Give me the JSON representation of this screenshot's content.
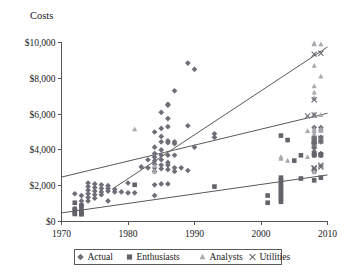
{
  "chart_data": {
    "type": "scatter",
    "title": "",
    "ylabel": "Costs",
    "xlabel": "",
    "xlim": [
      1970,
      2010
    ],
    "ylim": [
      0,
      10000
    ],
    "grid": false,
    "legend_position": "bottom",
    "xticks": [
      "1970",
      "1980",
      "1990",
      "2000",
      "2010"
    ],
    "xtick_values": [
      1970,
      1980,
      1990,
      2000,
      2010
    ],
    "yticks": [
      "$0",
      "$2,000",
      "$4,000",
      "$6,000",
      "$8,000",
      "$10,000"
    ],
    "ytick_values": [
      0,
      2000,
      4000,
      6000,
      8000,
      10000
    ],
    "series": [
      {
        "name": "Actual",
        "marker": "diamond",
        "color": "#6e6e78",
        "points": [
          [
            1972,
            1550
          ],
          [
            1972,
            700
          ],
          [
            1973,
            1450
          ],
          [
            1973,
            1150
          ],
          [
            1973,
            900
          ],
          [
            1974,
            2150
          ],
          [
            1974,
            1950
          ],
          [
            1974,
            1750
          ],
          [
            1974,
            1550
          ],
          [
            1974,
            1350
          ],
          [
            1974,
            1150
          ],
          [
            1975,
            2100
          ],
          [
            1975,
            1900
          ],
          [
            1975,
            1700
          ],
          [
            1975,
            1500
          ],
          [
            1975,
            1300
          ],
          [
            1976,
            2050
          ],
          [
            1976,
            1850
          ],
          [
            1976,
            1650
          ],
          [
            1976,
            1500
          ],
          [
            1977,
            2000
          ],
          [
            1977,
            1850
          ],
          [
            1977,
            1700
          ],
          [
            1977,
            1150
          ],
          [
            1978,
            1800
          ],
          [
            1978,
            1650
          ],
          [
            1979,
            1650
          ],
          [
            1980,
            2150
          ],
          [
            1980,
            1600
          ],
          [
            1981,
            1600
          ],
          [
            1982,
            3050
          ],
          [
            1983,
            3450
          ],
          [
            1983,
            3000
          ],
          [
            1984,
            5000
          ],
          [
            1984,
            4150
          ],
          [
            1984,
            3800
          ],
          [
            1984,
            3600
          ],
          [
            1984,
            3400
          ],
          [
            1984,
            3200
          ],
          [
            1984,
            3000
          ],
          [
            1984,
            2800
          ],
          [
            1984,
            2050
          ],
          [
            1984,
            1450
          ],
          [
            1985,
            6100
          ],
          [
            1985,
            5200
          ],
          [
            1985,
            4750
          ],
          [
            1985,
            4450
          ],
          [
            1985,
            4000
          ],
          [
            1985,
            3700
          ],
          [
            1985,
            3450
          ],
          [
            1985,
            3150
          ],
          [
            1985,
            2950
          ],
          [
            1985,
            2100
          ],
          [
            1986,
            6550
          ],
          [
            1986,
            6500
          ],
          [
            1986,
            5750
          ],
          [
            1986,
            5300
          ],
          [
            1986,
            4500
          ],
          [
            1986,
            4400
          ],
          [
            1986,
            3700
          ],
          [
            1986,
            3300
          ],
          [
            1986,
            3150
          ],
          [
            1986,
            2900
          ],
          [
            1986,
            2100
          ],
          [
            1987,
            7300
          ],
          [
            1987,
            4450
          ],
          [
            1987,
            4350
          ],
          [
            1987,
            3700
          ],
          [
            1987,
            3000
          ],
          [
            1987,
            2800
          ],
          [
            1988,
            3000
          ],
          [
            1989,
            8850
          ],
          [
            1989,
            5350
          ],
          [
            1989,
            2850
          ],
          [
            1990,
            8500
          ],
          [
            1990,
            4150
          ],
          [
            1993,
            4900
          ],
          [
            1993,
            4700
          ],
          [
            2008,
            5250
          ],
          [
            2008,
            4700
          ],
          [
            2008,
            4400
          ],
          [
            2008,
            4100
          ],
          [
            2008,
            3900
          ],
          [
            2008,
            3800
          ],
          [
            2008,
            3700
          ],
          [
            2009,
            5250
          ],
          [
            2009,
            5100
          ],
          [
            2009,
            4700
          ],
          [
            2009,
            4450
          ],
          [
            2009,
            3800
          ],
          [
            2009,
            3700
          ]
        ]
      },
      {
        "name": "Enthusiasts",
        "marker": "square",
        "color": "#63636b",
        "points": [
          [
            1972,
            1050
          ],
          [
            1972,
            700
          ],
          [
            1972,
            500
          ],
          [
            1972,
            420
          ],
          [
            1973,
            900
          ],
          [
            1973,
            700
          ],
          [
            1973,
            560
          ],
          [
            1973,
            450
          ],
          [
            1973,
            400
          ],
          [
            1981,
            2050
          ],
          [
            1993,
            1950
          ],
          [
            2001,
            1450
          ],
          [
            2001,
            1050
          ],
          [
            2003,
            2450
          ],
          [
            2003,
            2300
          ],
          [
            2003,
            2150
          ],
          [
            2003,
            2000
          ],
          [
            2003,
            1850
          ],
          [
            2003,
            1700
          ],
          [
            2003,
            1550
          ],
          [
            2003,
            1400
          ],
          [
            2003,
            1250
          ],
          [
            2003,
            1100
          ],
          [
            2003,
            4800
          ],
          [
            2004,
            4550
          ],
          [
            2005,
            3400
          ],
          [
            2006,
            2400
          ],
          [
            2006,
            3700
          ],
          [
            2008,
            3750
          ],
          [
            2008,
            3700
          ],
          [
            2008,
            2300
          ],
          [
            2008,
            2850
          ],
          [
            2009,
            3750
          ],
          [
            2009,
            3700
          ],
          [
            2009,
            2450
          ]
        ]
      },
      {
        "name": "Analysts",
        "marker": "triangle",
        "color": "#a9a9b0",
        "points": [
          [
            1981,
            5150
          ],
          [
            1984,
            3100
          ],
          [
            1984,
            2800
          ],
          [
            2003,
            3600
          ],
          [
            2003,
            3500
          ],
          [
            2004,
            3400
          ],
          [
            2007,
            5050
          ],
          [
            2007,
            3600
          ],
          [
            2008,
            9950
          ],
          [
            2008,
            9900
          ],
          [
            2008,
            8700
          ],
          [
            2008,
            7550
          ],
          [
            2008,
            7200
          ],
          [
            2008,
            6900
          ],
          [
            2008,
            6000
          ],
          [
            2008,
            5900
          ],
          [
            2008,
            5150
          ],
          [
            2008,
            5050
          ],
          [
            2008,
            4900
          ],
          [
            2008,
            2850
          ],
          [
            2008,
            2750
          ],
          [
            2009,
            9900
          ],
          [
            2009,
            8100
          ],
          [
            2009,
            5950
          ],
          [
            2009,
            5150
          ],
          [
            2009,
            5050
          ]
        ]
      },
      {
        "name": "Utilities",
        "marker": "cross",
        "color": "#6b6b73",
        "points": [
          [
            2007,
            5900
          ],
          [
            2008,
            9350
          ],
          [
            2008,
            6800
          ],
          [
            2008,
            5950
          ],
          [
            2008,
            4600
          ],
          [
            2008,
            4500
          ],
          [
            2008,
            4450
          ],
          [
            2008,
            4350
          ],
          [
            2008,
            4250
          ],
          [
            2008,
            3000
          ],
          [
            2008,
            2950
          ],
          [
            2009,
            9400
          ],
          [
            2009,
            4650
          ],
          [
            2009,
            4500
          ],
          [
            2009,
            3150
          ],
          [
            2009,
            3050
          ]
        ]
      }
    ],
    "trend_lines": [
      {
        "name": "analysts-trend",
        "x0": 1978,
        "y0": 1900,
        "x1": 2010,
        "y1": 9750
      },
      {
        "name": "actual-trend",
        "x0": 1970,
        "y0": 2480,
        "x1": 2010,
        "y1": 6050
      },
      {
        "name": "enthusiasts-trend",
        "x0": 1970,
        "y0": 480,
        "x1": 2010,
        "y1": 2600
      }
    ]
  },
  "legend": {
    "items": [
      {
        "label": "Actual",
        "marker": "diamond",
        "color": "#6e6e78"
      },
      {
        "label": "Enthusiasts",
        "marker": "square",
        "color": "#63636b"
      },
      {
        "label": "Analysts",
        "marker": "triangle",
        "color": "#a9a9b0"
      },
      {
        "label": "Utilities",
        "marker": "cross",
        "color": "#6b6b73"
      }
    ]
  }
}
